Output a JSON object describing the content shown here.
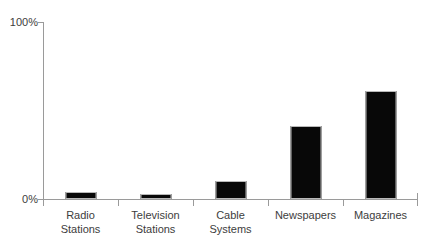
{
  "chart_data": {
    "type": "bar",
    "title": "",
    "subtitle": "",
    "xlabel": "",
    "ylabel": "",
    "categories": [
      "Radio Stations",
      "Television Stations",
      "Cable Systems",
      "Newspapers",
      "Magazines"
    ],
    "category_lines": [
      [
        "Radio",
        "Stations"
      ],
      [
        "Television",
        "Stations"
      ],
      [
        "Cable",
        "Systems"
      ],
      [
        "Newspapers"
      ],
      [
        "Magazines"
      ]
    ],
    "values": [
      4,
      3,
      10,
      41,
      61
    ],
    "ylim": [
      0,
      100
    ],
    "ytick_labels": [
      "0%",
      "100%"
    ],
    "ytick_values": [
      0,
      100
    ],
    "grid": false,
    "legend": false,
    "legend_position": "none",
    "bar_color": "#080808",
    "bar_edge_color": "#b9b9b9",
    "axis_color": "#9a9a9a",
    "background_color": "#ffffff",
    "text_color": "#3d3d3d"
  },
  "axes": {
    "y_top_label": "100%",
    "y_bottom_label": "0%"
  }
}
